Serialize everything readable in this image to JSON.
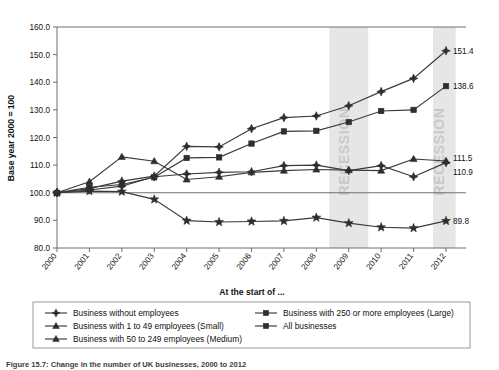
{
  "figure": {
    "caption": "Figure 15.7: Change in the number of UK businesses, 2000 to 2012",
    "xlabel": "At the start of ...",
    "ylabel": "Base year 2000 = 100"
  },
  "annotations": [
    {
      "name": "recession-band-1",
      "label": "RECESSION",
      "start": 2008.4,
      "end": 2009.6
    },
    {
      "name": "recession-band-2",
      "label": "RECESSION",
      "start": 2011.6,
      "end": 2012.3
    }
  ],
  "chart_data": {
    "type": "line",
    "title": "",
    "subtitle": "",
    "xlabel": "At the start of ...",
    "ylabel": "Base year 2000 = 100",
    "grid": false,
    "legend_position": "bottom",
    "xlim": [
      2000,
      2012
    ],
    "ylim": [
      80.0,
      160.0
    ],
    "ytick_labels": [
      "80.0",
      "90.0",
      "100.0",
      "110.0",
      "120.0",
      "130.0",
      "140.0",
      "150.0",
      "160.0"
    ],
    "yticks": [
      80,
      90,
      100,
      110,
      120,
      130,
      140,
      150,
      160
    ],
    "categories": [
      "2000",
      "2001",
      "2002",
      "2003",
      "2004",
      "2005",
      "2006",
      "2007",
      "2008",
      "2009",
      "2010",
      "2011",
      "2012"
    ],
    "x": [
      2000,
      2001,
      2002,
      2003,
      2004,
      2005,
      2006,
      2007,
      2008,
      2009,
      2010,
      2011,
      2012
    ],
    "series": [
      {
        "name": "Business without employees",
        "marker": "diamond",
        "end_label": "151.4",
        "values": [
          100.0,
          101.5,
          104.2,
          106.0,
          116.8,
          116.6,
          123.2,
          127.2,
          127.8,
          131.5,
          136.6,
          141.4,
          151.4
        ]
      },
      {
        "name": "Business with 1 to 49 employees (Small)",
        "marker": "star",
        "end_label": "89.8",
        "values": [
          100.0,
          100.6,
          100.4,
          97.6,
          89.9,
          89.4,
          89.6,
          89.8,
          91.0,
          89.0,
          87.5,
          87.2,
          89.8
        ]
      },
      {
        "name": "Business with 50 to 249 employees (Medium)",
        "marker": "triangle",
        "end_label": "111.5",
        "values": [
          100.0,
          104.0,
          113.0,
          111.4,
          104.8,
          105.8,
          107.4,
          108.0,
          108.4,
          108.2,
          108.0,
          112.2,
          111.5
        ]
      },
      {
        "name": "Business with 250 or more employees (Large)",
        "marker": "square",
        "end_label": "138.6",
        "values": [
          100.0,
          102.0,
          103.0,
          105.6,
          112.6,
          112.8,
          117.8,
          122.2,
          122.4,
          125.6,
          129.6,
          130.0,
          138.6
        ]
      },
      {
        "name": "All businesses",
        "marker": "diamond-filled",
        "end_label": "110.9",
        "values": [
          100.0,
          101.0,
          102.4,
          105.8,
          106.8,
          107.4,
          107.6,
          109.8,
          110.0,
          108.0,
          109.8,
          105.8,
          110.9
        ]
      }
    ],
    "value_labels": [
      "151.4",
      "138.6",
      "111.5",
      "110.9",
      "89.8"
    ]
  },
  "legend": {
    "entries": [
      {
        "label": "Business without employees",
        "marker": "diamond"
      },
      {
        "label": "Business with 1 to 49 employees (Small)",
        "marker": "triangle"
      },
      {
        "label": "Business with 50 to 249 employees (Medium)",
        "marker": "triangle"
      },
      {
        "label": "Business with 250 or more employees (Large)",
        "marker": "square"
      },
      {
        "label": "All businesses",
        "marker": "square"
      }
    ]
  }
}
